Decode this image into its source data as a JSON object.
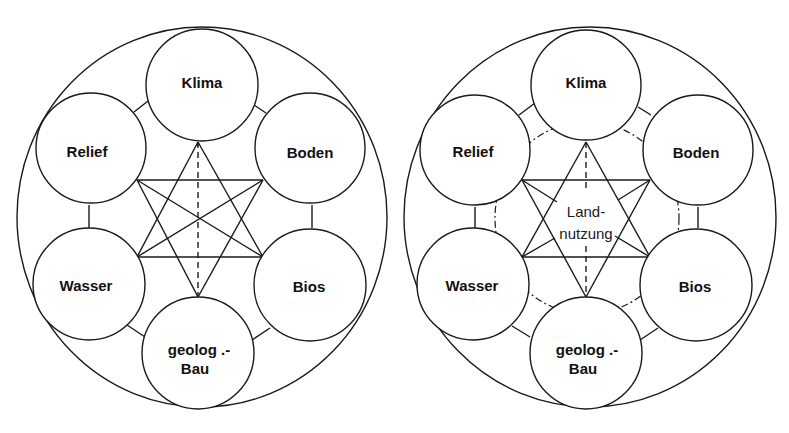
{
  "colors": {
    "stroke": "#1a1a1a",
    "background": "#ffffff"
  },
  "diagrams": [
    {
      "id": "left",
      "nodes": [
        {
          "key": "klima",
          "label": "Klima"
        },
        {
          "key": "relief",
          "label": "Relief"
        },
        {
          "key": "boden",
          "label": "Boden"
        },
        {
          "key": "wasser",
          "label": "Wasser"
        },
        {
          "key": "bios",
          "label": "Bios"
        },
        {
          "key": "geolog",
          "label_line1": "geolog .-",
          "label_line2": "Bau"
        }
      ]
    },
    {
      "id": "right",
      "nodes": [
        {
          "key": "klima",
          "label": "Klima"
        },
        {
          "key": "relief",
          "label": "Relief"
        },
        {
          "key": "boden",
          "label": "Boden"
        },
        {
          "key": "wasser",
          "label": "Wasser"
        },
        {
          "key": "bios",
          "label": "Bios"
        },
        {
          "key": "geolog",
          "label_line1": "geolog .-",
          "label_line2": "Bau"
        }
      ],
      "center": {
        "label_line1": "Land-",
        "label_line2": "nutzung"
      }
    }
  ]
}
